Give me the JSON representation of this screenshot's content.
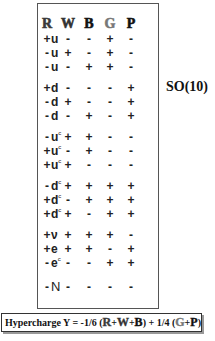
{
  "table": {
    "columns": [
      {
        "label": "R",
        "color": "#3a3a3a"
      },
      {
        "label": "W",
        "color": "#333333"
      },
      {
        "label": "B",
        "color": "#111111"
      },
      {
        "label": "G",
        "color": "#777777"
      },
      {
        "label": "P",
        "color": "#111111"
      }
    ],
    "rows": [
      {
        "particle": "u",
        "conj": "",
        "signs": [
          "+",
          "-",
          "-",
          "+",
          "-"
        ]
      },
      {
        "particle": "u",
        "conj": "",
        "signs": [
          "-",
          "+",
          "-",
          "+",
          "-"
        ]
      },
      {
        "particle": "u",
        "conj": "",
        "signs": [
          "-",
          "-",
          "+",
          "+",
          "-"
        ]
      },
      {
        "particle": "d",
        "conj": "",
        "signs": [
          "+",
          "-",
          "-",
          "-",
          "+"
        ]
      },
      {
        "particle": "d",
        "conj": "",
        "signs": [
          "-",
          "+",
          "-",
          "-",
          "+"
        ]
      },
      {
        "particle": "d",
        "conj": "",
        "signs": [
          "-",
          "-",
          "+",
          "-",
          "+"
        ]
      },
      {
        "particle": "u",
        "conj": "c",
        "signs": [
          "-",
          "+",
          "+",
          "-",
          "-"
        ]
      },
      {
        "particle": "u",
        "conj": "c",
        "signs": [
          "+",
          "-",
          "+",
          "-",
          "-"
        ]
      },
      {
        "particle": "u",
        "conj": "c",
        "signs": [
          "+",
          "+",
          "-",
          "-",
          "-"
        ]
      },
      {
        "particle": "d",
        "conj": "c",
        "signs": [
          "-",
          "+",
          "+",
          "+",
          "+"
        ]
      },
      {
        "particle": "d",
        "conj": "c",
        "signs": [
          "+",
          "-",
          "+",
          "+",
          "+"
        ]
      },
      {
        "particle": "d",
        "conj": "c",
        "signs": [
          "+",
          "+",
          "-",
          "+",
          "+"
        ]
      },
      {
        "particle": "ν",
        "conj": "",
        "signs": [
          "+",
          "+",
          "+",
          "+",
          "-"
        ]
      },
      {
        "particle": "e",
        "conj": "",
        "signs": [
          "+",
          "+",
          "+",
          "-",
          "+"
        ]
      },
      {
        "particle": "e",
        "conj": "c",
        "signs": [
          "-",
          "-",
          "-",
          "+",
          "+"
        ]
      },
      {
        "particle": "N",
        "conj": "",
        "signs": [
          "-",
          "-",
          "-",
          "-",
          "-"
        ]
      }
    ]
  },
  "group_label": "SO(10)",
  "formula": {
    "prefix": "Hypercharge Y  =  -1/6 (",
    "term1": "R",
    "plus1": "+",
    "term2": "W",
    "plus2": "+",
    "term3": "B",
    "mid": ")  + 1/4 (",
    "term4": "G",
    "plus3": "+",
    "term5": "P",
    "suffix": ")"
  }
}
